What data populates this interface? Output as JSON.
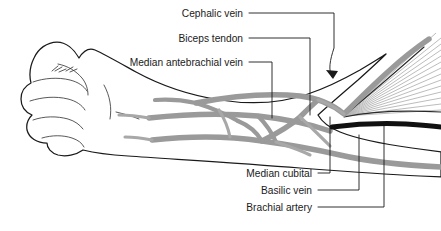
{
  "figure": {
    "background_color": "#ffffff",
    "width": 441,
    "height": 231
  },
  "colors": {
    "background": "#ffffff",
    "outline": "#1a1a1a",
    "vein": "#9a9a9a",
    "vein_light": "#a8a8a8",
    "artery": "#111111",
    "tendon": "#b4b4b4",
    "tendon_edge": "#2a2a2a",
    "label_text": "#1a1a1a",
    "leader_line": "#1a1a1a"
  },
  "labels": [
    {
      "id": "cephalic-vein",
      "text": "Cephalic vein",
      "text_x": 243,
      "text_y": 17,
      "anchor": "end",
      "has_arrowhead": true,
      "structure": "vein"
    },
    {
      "id": "biceps-tendon",
      "text": "Biceps tendon",
      "text_x": 243,
      "text_y": 42,
      "anchor": "end",
      "has_arrowhead": false,
      "structure": "tendon"
    },
    {
      "id": "median-antebrachial-vein",
      "text": "Median antebrachial vein",
      "text_x": 243,
      "text_y": 66,
      "anchor": "end",
      "has_arrowhead": false,
      "structure": "vein"
    },
    {
      "id": "median-cubital",
      "text": "Median cubital",
      "text_x": 312,
      "text_y": 177,
      "anchor": "end",
      "has_arrowhead": false,
      "structure": "vein"
    },
    {
      "id": "basilic-vein",
      "text": "Basilic vein",
      "text_x": 312,
      "text_y": 194,
      "anchor": "end",
      "has_arrowhead": false,
      "structure": "vein"
    },
    {
      "id": "brachial-artery",
      "text": "Brachial artery",
      "text_x": 312,
      "text_y": 211,
      "anchor": "end",
      "has_arrowhead": false,
      "structure": "artery"
    }
  ]
}
